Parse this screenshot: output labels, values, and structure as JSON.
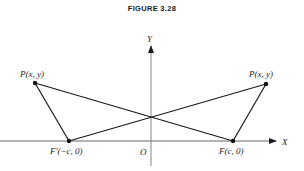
{
  "figure": {
    "title": "FIGURE 3.28"
  },
  "axes": {
    "x_label": "X",
    "y_label": "Y",
    "origin_label": "O"
  },
  "points": {
    "p_left": {
      "label": "P(x, y)"
    },
    "p_right": {
      "label": "P(x, y)"
    },
    "f_prime": {
      "label": "F′(−c, 0)"
    },
    "f": {
      "label": "F(c, 0)"
    }
  },
  "colors": {
    "line": "#1a1a1a",
    "axis": "#555555"
  }
}
